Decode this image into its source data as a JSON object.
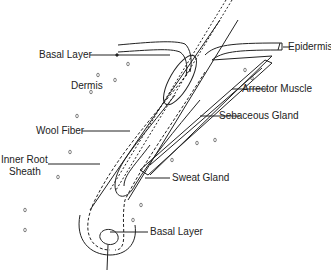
{
  "diagram": {
    "labels": {
      "basal_layer_top": "Basal Layer",
      "epidermis": "Epidermis",
      "dermis": "Dermis",
      "arrector_muscle": "Arrector Muscle",
      "sebaceous_gland": "Sebaceous Gland",
      "wool_fiber": "Wool Fiber",
      "inner_root_sheath_1": "Inner Root",
      "inner_root_sheath_2": "Sheath",
      "sweat_gland": "Sweat Gland",
      "basal_layer_bottom": "Basal Layer"
    },
    "colors": {
      "ink": "#222222",
      "background": "#ffffff"
    }
  }
}
